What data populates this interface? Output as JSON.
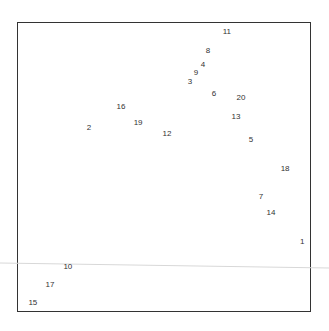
{
  "chart_data": {
    "type": "scatter",
    "title": "",
    "xlabel": "",
    "ylabel": "",
    "grid": false,
    "legend": null,
    "marker": "text-labels",
    "note": "Points are drawn as their numeric labels; coordinates are in pixel-derived units (0-100 within frame).",
    "xlim": [
      0,
      100
    ],
    "ylim": [
      0,
      100
    ],
    "points": [
      {
        "label": "1",
        "x": 97.0,
        "y": 24.1
      },
      {
        "label": "2",
        "x": 24.5,
        "y": 63.4
      },
      {
        "label": "3",
        "x": 58.8,
        "y": 79.3
      },
      {
        "label": "4",
        "x": 63.3,
        "y": 85.2
      },
      {
        "label": "5",
        "x": 79.6,
        "y": 59.3
      },
      {
        "label": "6",
        "x": 67.0,
        "y": 75.2
      },
      {
        "label": "7",
        "x": 83.0,
        "y": 39.7
      },
      {
        "label": "8",
        "x": 65.0,
        "y": 90.0
      },
      {
        "label": "9",
        "x": 60.9,
        "y": 82.4
      },
      {
        "label": "10",
        "x": 17.3,
        "y": 15.5
      },
      {
        "label": "11",
        "x": 71.4,
        "y": 96.6
      },
      {
        "label": "12",
        "x": 51.0,
        "y": 61.4
      },
      {
        "label": "13",
        "x": 74.5,
        "y": 67.2
      },
      {
        "label": "14",
        "x": 86.4,
        "y": 34.1
      },
      {
        "label": "15",
        "x": 5.4,
        "y": 3.1
      },
      {
        "label": "16",
        "x": 35.4,
        "y": 70.7
      },
      {
        "label": "17",
        "x": 11.2,
        "y": 9.3
      },
      {
        "label": "18",
        "x": 91.2,
        "y": 49.3
      },
      {
        "label": "19",
        "x": 41.2,
        "y": 65.2
      },
      {
        "label": "20",
        "x": 76.2,
        "y": 73.8
      }
    ]
  },
  "plot": {
    "frame_color": "#333333",
    "label_color": "#333333",
    "artifact_line_color": "#d8d8d8"
  }
}
